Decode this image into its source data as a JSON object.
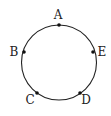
{
  "diagram": {
    "type": "circle-with-points",
    "circle": {
      "cx": 59,
      "cy": 62.5,
      "r": 37.5,
      "stroke": "#222222"
    },
    "points": [
      {
        "name": "A",
        "x": 59,
        "y": 25,
        "label_x": 58,
        "label_y": 19
      },
      {
        "name": "B",
        "x": 24,
        "y": 52,
        "label_x": 14,
        "label_y": 56
      },
      {
        "name": "E",
        "x": 93,
        "y": 52,
        "label_x": 102,
        "label_y": 56
      },
      {
        "name": "C",
        "x": 37,
        "y": 93,
        "label_x": 30,
        "label_y": 104
      },
      {
        "name": "D",
        "x": 80,
        "y": 93,
        "label_x": 86,
        "label_y": 104
      }
    ]
  }
}
